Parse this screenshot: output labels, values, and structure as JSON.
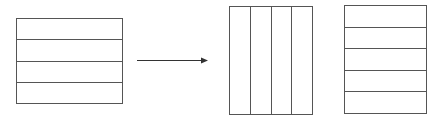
{
  "diagram": {
    "stroke_color": "#555555",
    "left_box": {
      "x": 16,
      "y": 18,
      "w": 106,
      "h": 85,
      "rows": 4,
      "columns": 1
    },
    "arrow": {
      "x1": 137,
      "y1": 60,
      "x2": 208,
      "y2": 60,
      "direction": "right"
    },
    "middle_box": {
      "x": 229,
      "y": 6,
      "w": 83,
      "h": 108,
      "rows": 1,
      "columns": 4
    },
    "right_box": {
      "x": 344,
      "y": 5,
      "w": 82,
      "h": 108,
      "rows": 5,
      "columns": 1
    }
  }
}
